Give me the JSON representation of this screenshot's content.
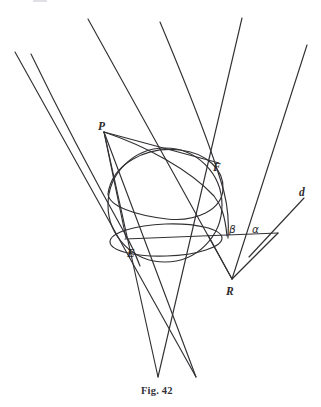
{
  "figure": {
    "caption": "Fig. 42",
    "caption_position": {
      "x": 160,
      "y": 392
    },
    "background_color": "#ffffff",
    "ink_color": "#333034",
    "width": 321,
    "height": 407
  },
  "labels": [
    {
      "id": "P",
      "text": "P",
      "x": 101,
      "y": 126,
      "kind": "point"
    },
    {
      "id": "F",
      "text": "F",
      "x": 216,
      "y": 167,
      "kind": "point"
    },
    {
      "id": "E",
      "text": "E",
      "x": 131,
      "y": 253,
      "kind": "point"
    },
    {
      "id": "R",
      "text": "R",
      "x": 229,
      "y": 291,
      "kind": "point"
    },
    {
      "id": "d",
      "text": "d",
      "x": 300,
      "y": 192,
      "kind": "line"
    },
    {
      "id": "beta",
      "text": "β",
      "x": 231,
      "y": 231,
      "kind": "angle"
    },
    {
      "id": "alpha",
      "text": "α",
      "x": 254,
      "y": 232,
      "kind": "angle"
    }
  ],
  "geometry": {
    "sphere": {
      "name": "inscribed-sphere",
      "center": {
        "cx": 165,
        "cy": 205
      },
      "radius": 57
    },
    "sphere_equator_ellipse": {
      "name": "sphere-equator",
      "cx": 165,
      "cy": 238,
      "rx": 57,
      "ry": 16,
      "rotation": -2
    },
    "sphere_upper_ellipse": {
      "name": "sphere-contact-circle",
      "cx": 163,
      "cy": 190,
      "rx": 62,
      "ry": 21,
      "rotation": -22
    },
    "cone_apex": {
      "x": 175,
      "y": 345
    },
    "cone_left_edge": {
      "x1": 15,
      "y1": 52,
      "x2": 196,
      "y2": 377
    },
    "cone_right_edge": {
      "x1": 242,
      "y1": 18,
      "x2": 158,
      "y2": 377
    },
    "cutting_plane": {
      "name": "cutting-plane-trace",
      "x1": 125,
      "y1": 239,
      "x2": 278,
      "y2": 233
    },
    "directrix_line_d": {
      "x1": 248,
      "y1": 255,
      "x2": 305,
      "y2": 197
    },
    "triangle_R": {
      "vertex": {
        "x": 232,
        "y": 279
      },
      "left": {
        "x": 206,
        "y": 235
      },
      "right": {
        "x": 278,
        "y": 233
      }
    },
    "parabola_left": {
      "start": {
        "x": 31,
        "y": 54
      },
      "end": {
        "x": 140,
        "y": 264
      }
    },
    "parabola_right": {
      "start": {
        "x": 160,
        "y": 22
      },
      "end": {
        "x": 228,
        "y": 236
      }
    },
    "ray_far_right": {
      "x1": 307,
      "y1": 45,
      "x2": 232,
      "y2": 279
    }
  },
  "description": {
    "type": "conic-section-dandelin-construction",
    "elements": [
      "cone generators",
      "inscribed sphere",
      "focal point F",
      "point P on conic",
      "point E tangency",
      "directrix d",
      "angles alpha and beta"
    ]
  }
}
